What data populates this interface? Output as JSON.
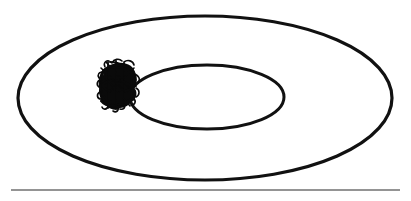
{
  "figure": {
    "title": "",
    "background_color": "#ffffff",
    "ink_color": "#111111",
    "width": 411,
    "height": 201,
    "shapes": {
      "outer_ellipse": {
        "name": "outer-ellipse",
        "cx": 205,
        "cy": 98,
        "rx": 187,
        "ry": 82,
        "stroke_width": 3.2,
        "stroke_color": "#111111",
        "fill": "none"
      },
      "inner_ellipse": {
        "name": "inner-ellipse",
        "cx": 207,
        "cy": 97,
        "rx": 77,
        "ry": 32,
        "stroke_width": 3.0,
        "stroke_color": "#111111",
        "fill": "none"
      },
      "baseline": {
        "name": "baseline-rule",
        "x1": 11,
        "y1": 190,
        "x2": 400,
        "y2": 190,
        "stroke_width": 1.1,
        "stroke_color": "#2b2b2b"
      },
      "scribble_blob": {
        "name": "scribble-blob",
        "center_x": 119,
        "center_y": 86,
        "width": 42,
        "height": 50,
        "fill_color": "#0a0a0a",
        "description": "dense hand-drawn scribble shading a sector of the annulus"
      }
    }
  }
}
